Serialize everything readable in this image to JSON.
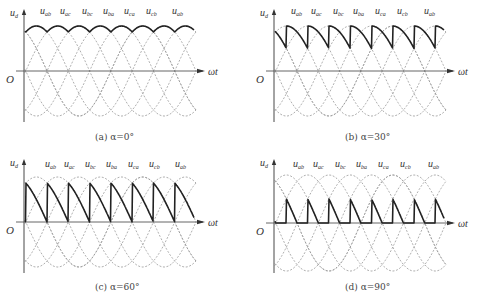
{
  "figure": {
    "panels": [
      {
        "id": "a",
        "caption": "(a) α=0°",
        "alpha": 0,
        "ox": 24,
        "oy": 71,
        "amp": 45,
        "xend": 205,
        "ytop": 8,
        "ybot": 122,
        "phase0": -5,
        "label_y": 14,
        "y_label": "u",
        "y_sub": "d",
        "x_label": "ωt",
        "origin_label": "O",
        "curve_labels": [
          "ab",
          "ac",
          "bc",
          "ba",
          "ca",
          "cb",
          "ab"
        ],
        "label_xs": [
          40,
          60,
          82,
          103,
          124,
          146,
          172
        ],
        "caption_x": 95,
        "caption_y": 140
      },
      {
        "id": "b",
        "caption": "(b) α=30°",
        "alpha": 30,
        "ox": 274,
        "oy": 71,
        "amp": 45,
        "xend": 455,
        "ytop": 8,
        "ybot": 122,
        "phase0": -5,
        "label_y": 14,
        "y_label": "u",
        "y_sub": "d",
        "x_label": "ωt",
        "origin_label": "O",
        "curve_labels": [
          "ab",
          "ac",
          "bc",
          "ba",
          "ca",
          "cb",
          "ab"
        ],
        "label_xs": [
          291,
          311,
          333,
          353,
          375,
          397,
          424
        ],
        "caption_x": 345,
        "caption_y": 140
      },
      {
        "id": "c",
        "caption": "(c) α=60°",
        "alpha": 60,
        "ox": 24,
        "oy": 222,
        "amp": 45,
        "xend": 205,
        "ytop": 158,
        "ybot": 273,
        "phase0": -5,
        "label_y": 167,
        "y_label": "u",
        "y_sub": "d",
        "x_label": "ωt",
        "origin_label": "O",
        "curve_labels": [
          "ab",
          "ac",
          "bc",
          "ba",
          "ca",
          "cb",
          "ab"
        ],
        "label_xs": [
          45,
          64,
          85,
          106,
          128,
          149,
          175
        ],
        "caption_x": 95,
        "caption_y": 290
      },
      {
        "id": "d",
        "caption": "(d) α=90°",
        "alpha": 90,
        "ox": 274,
        "oy": 223,
        "amp": 48,
        "xend": 455,
        "ytop": 158,
        "ybot": 273,
        "phase0": -5,
        "label_y": 167,
        "y_label": "u",
        "y_sub": "d",
        "x_label": "ωt",
        "origin_label": "O",
        "curve_labels": [
          "ab",
          "ac",
          "bc",
          "ba",
          "ca",
          "cb",
          "ab"
        ],
        "label_xs": [
          293,
          313,
          335,
          356,
          378,
          400,
          428
        ],
        "caption_x": 345,
        "caption_y": 290
      }
    ],
    "deg_per_px": 2.82
  },
  "chart_data": {
    "type": "line",
    "xlabel": "ωt",
    "ylabel": "u_d",
    "series_names": [
      "u_ab",
      "u_ac",
      "u_bc",
      "u_ba",
      "u_ca",
      "u_cb",
      "u_ab"
    ],
    "panels": [
      {
        "caption": "(a) α=0°",
        "alpha_deg": 0,
        "description": "Output follows the tops of line voltages; 6-pulse ripple, minimum at 0.866·peak"
      },
      {
        "caption": "(b) α=30°",
        "alpha_deg": 30,
        "description": "Each segment starts 30° late; voltage drops to 0.5·peak before jumping; still continuous positive"
      },
      {
        "caption": "(c) α=60°",
        "alpha_deg": 60,
        "description": "Segments decay to zero exactly at commutation then jump to peak; boundary continuous"
      },
      {
        "caption": "(d) α=90°",
        "alpha_deg": 90,
        "description": "Output reaches zero and stays at zero (resistive load) before next firing"
      }
    ],
    "grid": false,
    "legend": "inline curve labels above waveforms"
  }
}
